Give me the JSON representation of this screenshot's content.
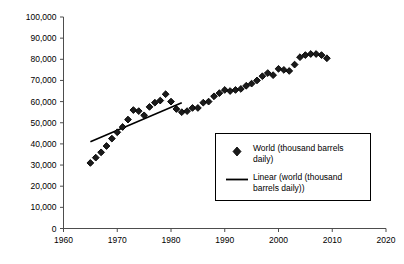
{
  "chart_data": {
    "type": "scatter",
    "title": "",
    "subtitle": "",
    "xlabel": "",
    "ylabel": "",
    "xlim": [
      1960,
      2020
    ],
    "ylim": [
      0,
      100000
    ],
    "grid": false,
    "legend_position": "inside-right",
    "x_ticks": [
      "1960",
      "1970",
      "1980",
      "1990",
      "2000",
      "2010",
      "2020"
    ],
    "x_tick_values": [
      1960,
      1970,
      1980,
      1990,
      2000,
      2010,
      2020
    ],
    "y_ticks": [
      "0",
      "10,000",
      "20,000",
      "30,000",
      "40,000",
      "50,000",
      "60,000",
      "70,000",
      "80,000",
      "90,000",
      "100,000"
    ],
    "y_tick_values": [
      0,
      10000,
      20000,
      30000,
      40000,
      50000,
      60000,
      70000,
      80000,
      90000,
      100000
    ],
    "series": [
      {
        "name": "World (thousand barrels daily)",
        "type": "scatter",
        "marker": "diamond",
        "color": "#1a1a1a",
        "x": [
          1965,
          1966,
          1967,
          1968,
          1969,
          1970,
          1971,
          1972,
          1973,
          1974,
          1975,
          1976,
          1977,
          1978,
          1979,
          1980,
          1981,
          1982,
          1983,
          1984,
          1985,
          1986,
          1987,
          1988,
          1989,
          1990,
          1991,
          1992,
          1993,
          1994,
          1995,
          1996,
          1997,
          1998,
          1999,
          2000,
          2001,
          2002,
          2003,
          2004,
          2005,
          2006,
          2007,
          2008,
          2009
        ],
        "values": [
          31000,
          33500,
          36000,
          39000,
          42500,
          45500,
          48000,
          51500,
          56000,
          55500,
          53500,
          57500,
          59500,
          60500,
          63500,
          60000,
          56500,
          55000,
          55500,
          57000,
          57000,
          59500,
          60000,
          62500,
          64000,
          65500,
          65000,
          65500,
          66000,
          67500,
          68500,
          70000,
          72000,
          73500,
          72500,
          75500,
          75000,
          74500,
          77500,
          81000,
          82000,
          82500,
          82500,
          82000,
          80500
        ]
      },
      {
        "name": "Linear (world (thousand barrels daily))",
        "type": "line",
        "color": "#000000",
        "x": [
          1965,
          1982
        ],
        "values": [
          41000,
          59500
        ]
      }
    ],
    "annotations": []
  },
  "legend": {
    "entries": [
      {
        "marker": "diamond",
        "label_line1": "World (thousand barrels",
        "label_line2": "daily)"
      },
      {
        "marker": "line",
        "label_line1": "Linear (world (thousand",
        "label_line2": "barrels daily))"
      }
    ]
  },
  "colors": {
    "marker": "#1a1a1a",
    "line": "#000000",
    "axis": "#4d4d4d",
    "text": "#000000",
    "background": "#ffffff",
    "legend_border": "#000000"
  }
}
